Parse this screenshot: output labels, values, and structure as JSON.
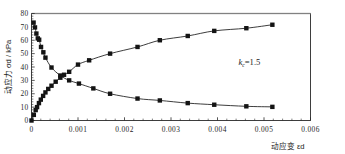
{
  "chart_data": {
    "type": "line",
    "title": "",
    "subtitle": "",
    "xlabel": "动应变 εd",
    "ylabel": "动应力 σd / kPa",
    "xlim": [
      0,
      0.006
    ],
    "ylim": [
      0,
      80
    ],
    "xticks": [
      0,
      0.001,
      0.002,
      0.003,
      0.004,
      0.005,
      0.006
    ],
    "xticklabels": [
      "0",
      "0.001",
      "0.002",
      "0.003",
      "0.004",
      "0.005",
      "0.006"
    ],
    "yticks": [
      0,
      10,
      20,
      30,
      40,
      50,
      60,
      70,
      80
    ],
    "yticklabels": [
      "0",
      "10",
      "20",
      "30",
      "40",
      "50",
      "60",
      "70",
      "80"
    ],
    "x_minor_per_major": 5,
    "y_minor_per_major": 5,
    "grid": false,
    "legend": null,
    "marker": "square",
    "marker_size": 2.2,
    "line_color": "#1a1a1a",
    "marker_color": "#141414",
    "background": "#ffffff",
    "frame_color": "#2a2a2a",
    "annotations": [
      {
        "name": "kc-annotation",
        "text": "k c = 1.5",
        "base": "k",
        "subscript": "c",
        "equals": "=1.5",
        "x": 0.00445,
        "y": 41.5
      }
    ],
    "series": [
      {
        "name": "descending-curve",
        "label": "",
        "points": [
          {
            "x": 4.5e-05,
            "y": 73.2
          },
          {
            "x": 7.5e-05,
            "y": 69.6
          },
          {
            "x": 0.000105,
            "y": 65.0
          },
          {
            "x": 0.000135,
            "y": 61.4
          },
          {
            "x": 0.000165,
            "y": 60.4
          },
          {
            "x": 0.000205,
            "y": 55.0
          },
          {
            "x": 0.000255,
            "y": 51.0
          },
          {
            "x": 0.0003,
            "y": 47.0
          },
          {
            "x": 0.00043,
            "y": 39.6
          },
          {
            "x": 0.00062,
            "y": 33.6
          },
          {
            "x": 0.00081,
            "y": 30.0
          },
          {
            "x": 0.00102,
            "y": 27.6
          },
          {
            "x": 0.00133,
            "y": 24.0
          },
          {
            "x": 0.00169,
            "y": 20.0
          },
          {
            "x": 0.00228,
            "y": 16.4
          },
          {
            "x": 0.00276,
            "y": 15.0
          },
          {
            "x": 0.00336,
            "y": 13.0
          },
          {
            "x": 0.00393,
            "y": 11.8
          },
          {
            "x": 0.00462,
            "y": 10.6
          },
          {
            "x": 0.00518,
            "y": 10.2
          }
        ]
      },
      {
        "name": "ascending-curve",
        "label": "",
        "points": [
          {
            "x": 0.0,
            "y": 0.0
          },
          {
            "x": 5e-05,
            "y": 4.2
          },
          {
            "x": 9e-05,
            "y": 7.8
          },
          {
            "x": 0.00012,
            "y": 10.0
          },
          {
            "x": 0.00016,
            "y": 13.0
          },
          {
            "x": 0.0002,
            "y": 15.6
          },
          {
            "x": 0.00025,
            "y": 18.4
          },
          {
            "x": 0.0003,
            "y": 21.0
          },
          {
            "x": 0.00036,
            "y": 23.6
          },
          {
            "x": 0.00043,
            "y": 26.0
          },
          {
            "x": 0.00052,
            "y": 29.0
          },
          {
            "x": 0.00062,
            "y": 32.0
          },
          {
            "x": 0.0007,
            "y": 34.2
          },
          {
            "x": 0.00081,
            "y": 36.4
          },
          {
            "x": 0.001,
            "y": 41.8
          },
          {
            "x": 0.00124,
            "y": 45.0
          },
          {
            "x": 0.00169,
            "y": 50.0
          },
          {
            "x": 0.00228,
            "y": 55.0
          },
          {
            "x": 0.00276,
            "y": 60.0
          },
          {
            "x": 0.00336,
            "y": 63.2
          },
          {
            "x": 0.00393,
            "y": 67.0
          },
          {
            "x": 0.00462,
            "y": 69.0
          },
          {
            "x": 0.00518,
            "y": 71.6
          }
        ]
      }
    ]
  }
}
